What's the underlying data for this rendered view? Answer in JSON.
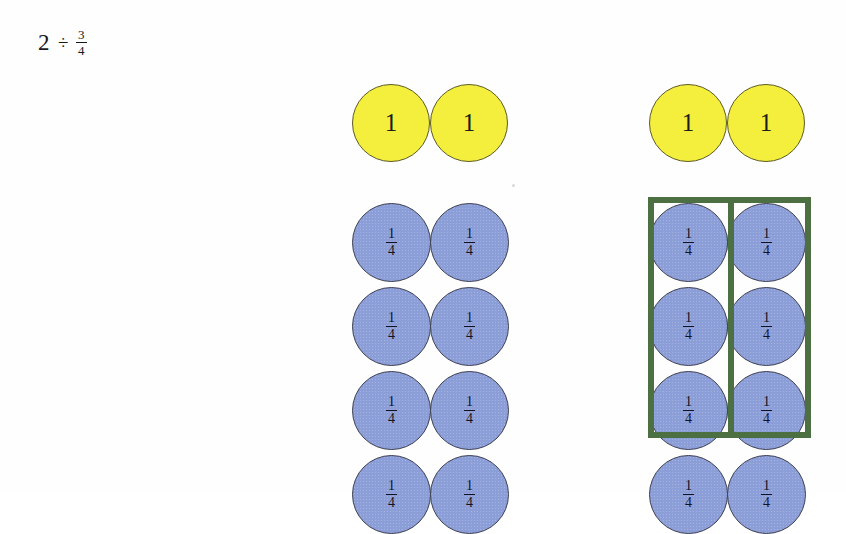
{
  "expression": {
    "whole": "2",
    "operator": "÷",
    "divisor_numerator": "3",
    "divisor_denominator": "4"
  },
  "labels": {
    "whole_circle": "1",
    "fraction_numerator": "1",
    "fraction_denominator": "4"
  },
  "colors": {
    "whole_circle_fill": "#f4ef3d",
    "whole_circle_stroke": "#5d5a23",
    "fraction_circle_fill": "#8b9ed8",
    "fraction_circle_stroke": "#3d3f52",
    "group_box_stroke": "#4c7042",
    "background": "#fefefe",
    "text": "#18181a"
  },
  "layout": {
    "left_group": {
      "whole_circles": 2,
      "fraction_rows": 4,
      "fraction_columns": 2,
      "whole_circle_diameter": 78,
      "fraction_circle_diameter": 79,
      "origin_x": 352,
      "whole_row_y": 84,
      "fraction_first_row_y": 203,
      "row_pitch": 84,
      "column_pitch": 78
    },
    "right_group": {
      "whole_circles": 2,
      "fraction_rows": 4,
      "fraction_columns": 2,
      "whole_circle_diameter": 78,
      "fraction_circle_diameter": 79,
      "origin_x": 649,
      "whole_row_y": 84,
      "fraction_first_row_y": 203,
      "row_pitch": 84,
      "column_pitch": 78,
      "group_box": {
        "x": 648,
        "y": 197,
        "width": 163,
        "height": 241,
        "divider_x": 728,
        "divider_width": 6,
        "encloses_rows": 3,
        "encloses_columns": 2
      }
    }
  }
}
